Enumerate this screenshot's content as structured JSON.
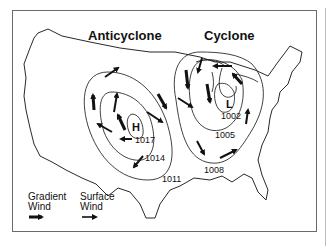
{
  "figure": {
    "titles": {
      "anticyclone": "Anticyclone",
      "cyclone": "Cyclone"
    },
    "centers": {
      "high": "H",
      "low": "L"
    },
    "isobars": {
      "high_1017": "1017",
      "high_1014": "1014",
      "outer_1011": "1011",
      "low_1002": "1002",
      "low_1005": "1005",
      "low_1008": "1008"
    },
    "legend": {
      "gradient_wind_line1": "Gradient",
      "gradient_wind_line2": "Wind",
      "surface_wind_line1": "Surface",
      "surface_wind_line2": "Wind"
    },
    "colors": {
      "ink": "#111111",
      "frame": "#6a6a6a",
      "background": "#ffffff"
    }
  }
}
